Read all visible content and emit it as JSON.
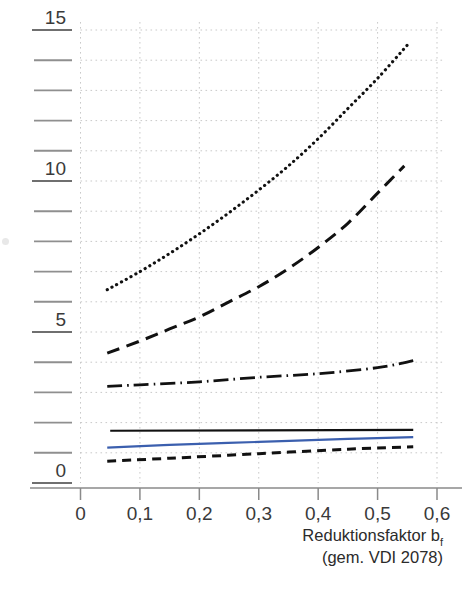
{
  "chart_data": {
    "type": "line",
    "title": "",
    "xlabel": "Reduktionsfaktor b_f (gem. VDI 2078)",
    "ylabel": "",
    "xlim": [
      0,
      0.65
    ],
    "ylim": [
      0,
      15.4
    ],
    "grid": true,
    "legend": "none",
    "x_ticks": [
      0,
      0.1,
      0.2,
      0.3,
      0.4,
      0.5,
      0.6
    ],
    "x_tick_labels": [
      "0",
      "0,1",
      "0,2",
      "0,3",
      "0,4",
      "0,5",
      "0,6"
    ],
    "y_ticks": [
      0,
      1,
      2,
      3,
      4,
      5,
      6,
      7,
      8,
      9,
      10,
      11,
      12,
      13,
      14,
      15
    ],
    "y_tick_labels": [
      "0",
      "",
      "",
      "",
      "",
      "5",
      "",
      "",
      "",
      "",
      "10",
      "",
      "",
      "",
      "",
      "15"
    ],
    "y_major_labels": [
      "0",
      "5",
      "10",
      "15"
    ],
    "series": [
      {
        "name": "dotted-steep",
        "style": "dotted",
        "color": "#111111",
        "x": [
          0.045,
          0.1,
          0.15,
          0.2,
          0.25,
          0.3,
          0.35,
          0.4,
          0.45,
          0.5,
          0.55
        ],
        "y": [
          6.4,
          7.0,
          7.6,
          8.25,
          8.95,
          9.7,
          10.5,
          11.4,
          12.4,
          13.4,
          14.5
        ]
      },
      {
        "name": "long-dash-steep",
        "style": "dashed",
        "color": "#111111",
        "x": [
          0.045,
          0.1,
          0.15,
          0.2,
          0.25,
          0.3,
          0.35,
          0.4,
          0.45,
          0.5,
          0.545
        ],
        "y": [
          4.3,
          4.7,
          5.1,
          5.5,
          6.0,
          6.5,
          7.1,
          7.8,
          8.6,
          9.6,
          10.5
        ]
      },
      {
        "name": "dash-dot-flat",
        "style": "dashdot",
        "color": "#111111",
        "x": [
          0.045,
          0.1,
          0.2,
          0.3,
          0.4,
          0.5,
          0.56
        ],
        "y": [
          3.2,
          3.25,
          3.35,
          3.5,
          3.62,
          3.82,
          4.05
        ]
      },
      {
        "name": "solid-black-flat",
        "style": "solid",
        "color": "#111111",
        "x": [
          0.05,
          0.56
        ],
        "y": [
          1.73,
          1.76
        ]
      },
      {
        "name": "solid-blue",
        "style": "solid",
        "color": "#3b5fae",
        "x": [
          0.045,
          0.15,
          0.3,
          0.45,
          0.56
        ],
        "y": [
          1.17,
          1.26,
          1.36,
          1.46,
          1.52
        ]
      },
      {
        "name": "short-dash-low",
        "style": "dashed-short",
        "color": "#111111",
        "x": [
          0.045,
          0.15,
          0.3,
          0.45,
          0.56
        ],
        "y": [
          0.72,
          0.82,
          0.97,
          1.12,
          1.2
        ]
      }
    ],
    "colors": {
      "grid": "#c9c9c9",
      "axis": "#8a8a8a",
      "ink": "#111111",
      "blue_series": "#3b5fae",
      "tick_text": "#3a3a3a"
    }
  },
  "axis": {
    "x_title_main": "Reduktionsfaktor b",
    "x_title_sub": "f",
    "x_title_second": "(gem. VDI 2078)"
  }
}
